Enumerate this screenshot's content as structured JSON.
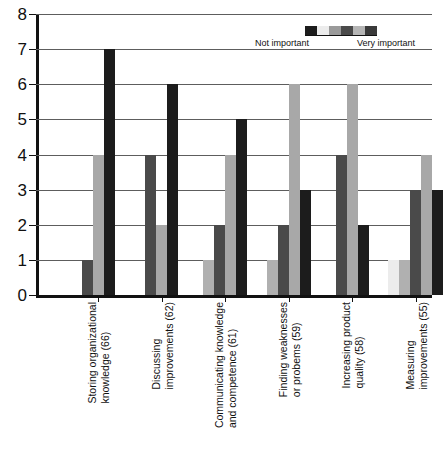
{
  "chart_data": {
    "type": "bar",
    "title": "",
    "xlabel": "",
    "ylabel": "",
    "ylim": [
      0,
      8
    ],
    "y_ticks": [
      0,
      1,
      2,
      3,
      4,
      5,
      6,
      7,
      8
    ],
    "grid": true,
    "legend": {
      "position": "top-right",
      "low_label": "Not important",
      "high_label": "Very important",
      "swatch_colors": [
        "#1c1c1c",
        "#ececec",
        "#9a9a9a",
        "#4a4a4a",
        "#b5b5b5",
        "#3a3a3a"
      ]
    },
    "series": [
      {
        "name": "1 - Not important",
        "color": "#ececec",
        "values": [
          0,
          0,
          0,
          0,
          0,
          1
        ]
      },
      {
        "name": "2",
        "color": "#b0b0b0",
        "values": [
          0,
          0,
          1,
          1,
          0,
          1
        ]
      },
      {
        "name": "3",
        "color": "#4a4a4a",
        "values": [
          1,
          4,
          2,
          2,
          4,
          3
        ]
      },
      {
        "name": "4",
        "color": "#a8a8a8",
        "values": [
          4,
          2,
          4,
          6,
          6,
          4
        ]
      },
      {
        "name": "5 - Very important",
        "color": "#1c1c1c",
        "values": [
          7,
          6,
          5,
          3,
          2,
          3
        ]
      }
    ],
    "categories": [
      {
        "line1": "Storing organizational",
        "line2": "knowledge (66)"
      },
      {
        "line1": "Discussing",
        "line2": "improvements (62)"
      },
      {
        "line1": "Communicating knowledge",
        "line2": "and competence (61)"
      },
      {
        "line1": "Finding weaknesses",
        "line2": "or probems (59)"
      },
      {
        "line1": "Increasing product",
        "line2": "quality (58)"
      },
      {
        "line1": "Measuring",
        "line2": "improvements (55)"
      }
    ],
    "groups": [
      {
        "category": "Storing organizational knowledge (66)",
        "bars": [
          {
            "value": 1,
            "color": "#4a4a4a"
          },
          {
            "value": 4,
            "color": "#a8a8a8"
          },
          {
            "value": 7,
            "color": "#1c1c1c"
          }
        ]
      },
      {
        "category": "Discussing improvements (62)",
        "bars": [
          {
            "value": 4,
            "color": "#4a4a4a"
          },
          {
            "value": 2,
            "color": "#a8a8a8"
          },
          {
            "value": 6,
            "color": "#1c1c1c"
          }
        ]
      },
      {
        "category": "Communicating knowledge and competence (61)",
        "bars": [
          {
            "value": 1,
            "color": "#b0b0b0"
          },
          {
            "value": 2,
            "color": "#4a4a4a"
          },
          {
            "value": 4,
            "color": "#a8a8a8"
          },
          {
            "value": 5,
            "color": "#1c1c1c"
          }
        ]
      },
      {
        "category": "Finding weaknesses or probems (59)",
        "bars": [
          {
            "value": 1,
            "color": "#b0b0b0"
          },
          {
            "value": 2,
            "color": "#4a4a4a"
          },
          {
            "value": 6,
            "color": "#a8a8a8"
          },
          {
            "value": 3,
            "color": "#1c1c1c"
          }
        ]
      },
      {
        "category": "Increasing product quality (58)",
        "bars": [
          {
            "value": 4,
            "color": "#4a4a4a"
          },
          {
            "value": 6,
            "color": "#a8a8a8"
          },
          {
            "value": 2,
            "color": "#1c1c1c"
          }
        ]
      },
      {
        "category": "Measuring improvements (55)",
        "bars": [
          {
            "value": 1,
            "color": "#ececec"
          },
          {
            "value": 1,
            "color": "#b0b0b0"
          },
          {
            "value": 3,
            "color": "#4a4a4a"
          },
          {
            "value": 4,
            "color": "#a8a8a8"
          },
          {
            "value": 3,
            "color": "#1c1c1c"
          }
        ]
      }
    ]
  }
}
